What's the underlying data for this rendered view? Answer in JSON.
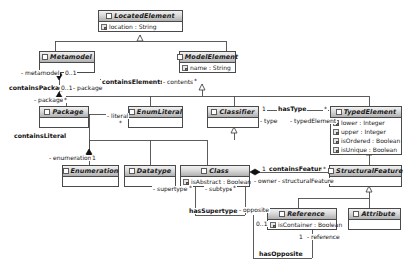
{
  "diagram": {
    "kind": "uml-class-diagram",
    "colors": {
      "line": "#4a4a4a",
      "header_light": "#f2f2f2",
      "header_dark": "#b0b0b0",
      "text": "#1a1a1a",
      "background": "#ffffff"
    }
  },
  "classes": [
    {
      "id": "LocatedElement",
      "name": "LocatedElement",
      "abstract": true,
      "attributes": [
        "location : String"
      ]
    },
    {
      "id": "Metamodel",
      "name": "Metamodel",
      "abstract": true,
      "attributes": []
    },
    {
      "id": "ModelElement",
      "name": "ModelElement",
      "abstract": true,
      "attributes": [
        "name : String"
      ]
    },
    {
      "id": "Package",
      "name": "Package",
      "abstract": true,
      "attributes": []
    },
    {
      "id": "EnumLiteral",
      "name": "EnumLiteral",
      "abstract": true,
      "attributes": []
    },
    {
      "id": "Classifier",
      "name": "Classifier",
      "abstract": true,
      "attributes": []
    },
    {
      "id": "TypedElement",
      "name": "TypedElement",
      "abstract": true,
      "attributes": [
        "lower : Integer",
        "upper : Integer",
        "isOrdered : Boolean",
        "isUnique : Boolean"
      ]
    },
    {
      "id": "Enumeration",
      "name": "Enumeration",
      "abstract": true,
      "attributes": []
    },
    {
      "id": "Datatype",
      "name": "Datatype",
      "abstract": true,
      "attributes": []
    },
    {
      "id": "Class",
      "name": "Class",
      "abstract": true,
      "attributes": [
        "isAbstract : Boolean"
      ]
    },
    {
      "id": "StructuralFeature",
      "name": "StructuralFeature",
      "abstract": true,
      "attributes": []
    },
    {
      "id": "Reference",
      "name": "Reference",
      "abstract": true,
      "attributes": [
        "isContainer : Boolean"
      ]
    },
    {
      "id": "Attribute",
      "name": "Attribute",
      "abstract": true,
      "attributes": []
    }
  ],
  "associations": [
    {
      "id": "containsPackage",
      "name": "containsPackage",
      "source_role": "- metamodel",
      "source_mult": "0..1",
      "target_role": "- package",
      "target_mult": "*",
      "mid_mult": "0..1",
      "mid_role": "- package"
    },
    {
      "id": "containsElements",
      "name": "containsElements",
      "target_role": "- contents",
      "target_mult": "*"
    },
    {
      "id": "containsLiteral",
      "name": "containsLiteral",
      "source_role": "- literal",
      "source_mult": "*",
      "target_role": "- enumeration",
      "target_mult": "1"
    },
    {
      "id": "hasType",
      "name": "hasType",
      "source_mult": "1",
      "source_role": "- type",
      "target_mult": "*",
      "target_role": "- typedElement"
    },
    {
      "id": "containsFeature",
      "name": "containsFeature",
      "source_mult": "1",
      "source_role": "- owner",
      "target_mult": "*",
      "target_role": "- structuralFeature"
    },
    {
      "id": "hasSupertype",
      "name": "hasSupertype",
      "source_role": "- supertype",
      "source_mult": "*",
      "target_role": "- subtype",
      "target_mult": "*"
    },
    {
      "id": "hasOpposite",
      "name": "hasOpposite",
      "source_role": "- opposite",
      "source_mult": "0..1",
      "target_mult": "1",
      "target_role": "- reference"
    }
  ],
  "generalizations": [
    {
      "child": "Metamodel",
      "parent": "LocatedElement"
    },
    {
      "child": "ModelElement",
      "parent": "LocatedElement"
    },
    {
      "child": "Package",
      "parent": "ModelElement"
    },
    {
      "child": "EnumLiteral",
      "parent": "ModelElement"
    },
    {
      "child": "Classifier",
      "parent": "ModelElement"
    },
    {
      "child": "TypedElement",
      "parent": "ModelElement"
    },
    {
      "child": "Enumeration",
      "parent": "Classifier"
    },
    {
      "child": "Datatype",
      "parent": "Classifier"
    },
    {
      "child": "Class",
      "parent": "Classifier"
    },
    {
      "child": "StructuralFeature",
      "parent": "TypedElement"
    },
    {
      "child": "Reference",
      "parent": "StructuralFeature"
    },
    {
      "child": "Attribute",
      "parent": "StructuralFeature"
    }
  ],
  "labels": {
    "containsPackage": "containsPackage",
    "containsElements": "containsElements",
    "containsLiteral": "containsLiteral",
    "hasType": "hasType",
    "containsFeature": "containsFeature",
    "hasSupertype": "hasSupertype",
    "hasOpposite": "hasOpposite",
    "metamodel_role": "- metamodel",
    "metamodel_mult": "0..1",
    "package_mult_mid": "0..1",
    "package_role_mid": "- package",
    "package_role": "- package",
    "package_mult": "*",
    "contents_role": "- contents",
    "contents_mult": "*",
    "literal_role": "- literal",
    "literal_mult": "*",
    "enumeration_role": "- enumeration",
    "enumeration_mult": "1",
    "type_mult": "1",
    "type_role": "- type",
    "typedElement_role": "- typedElement",
    "typedElement_mult": "*",
    "owner_mult": "1",
    "owner_role": "- owner",
    "structuralFeature_role": "- structuralFeature",
    "structuralFeature_mult": "*",
    "supertype_role": "- supertype",
    "supertype_mult": "*",
    "subtype_role": "- subtype",
    "subtype_mult": "*",
    "opposite_role": "- opposite",
    "opposite_mult": "0..1",
    "reference_mult": "1",
    "reference_role": "- reference"
  }
}
